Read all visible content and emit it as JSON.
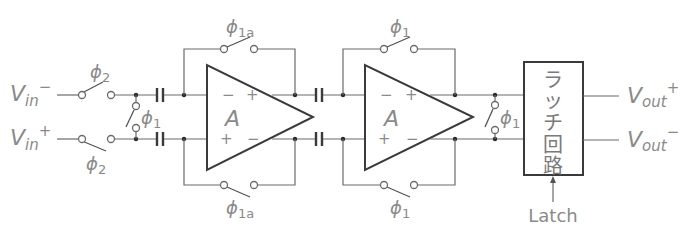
{
  "diagram": {
    "type": "circuit-schematic",
    "inputs": {
      "vin_minus": {
        "base": "V",
        "sub": "in",
        "sup": "−"
      },
      "vin_plus": {
        "base": "V",
        "sub": "in",
        "sup": "+"
      }
    },
    "outputs": {
      "vout_plus": {
        "base": "V",
        "sub": "out",
        "sup": "+"
      },
      "vout_minus": {
        "base": "V",
        "sub": "out",
        "sup": "−"
      }
    },
    "switch_labels": {
      "input_top": {
        "sym": "ϕ",
        "sub": "2"
      },
      "input_bottom": {
        "sym": "ϕ",
        "sub": "2"
      },
      "input_short": {
        "sym": "ϕ",
        "sub": "1"
      },
      "stage1_top": {
        "sym": "ϕ",
        "sub": "1a"
      },
      "stage1_bottom": {
        "sym": "ϕ",
        "sub": "1a"
      },
      "stage2_top": {
        "sym": "ϕ",
        "sub": "1"
      },
      "stage2_bottom": {
        "sym": "ϕ",
        "sub": "1"
      },
      "output_short": {
        "sym": "ϕ",
        "sub": "1"
      }
    },
    "amplifiers": [
      {
        "gain_label": "A",
        "in_top": "−",
        "in_bottom": "+",
        "out_top": "+",
        "out_bottom": "−"
      },
      {
        "gain_label": "A",
        "in_top": "−",
        "in_bottom": "+",
        "out_top": "+",
        "out_bottom": "−"
      }
    ],
    "latch_block": {
      "label_chars": [
        "ラ",
        "ッ",
        "チ",
        "回",
        "路"
      ],
      "control_label": "Latch"
    }
  }
}
